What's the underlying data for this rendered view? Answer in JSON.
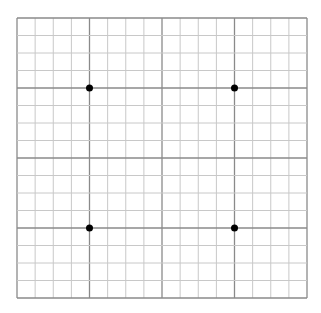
{
  "grid": {
    "left": 17,
    "top": 18,
    "right": 307,
    "bottom": 298,
    "columns": 16,
    "rows": 16,
    "major_every": 4,
    "minor_color": "#c8c8c8",
    "major_color": "#8a8a8a",
    "background": "#ffffff"
  },
  "points": [
    {
      "col": 4,
      "row": 4
    },
    {
      "col": 12,
      "row": 4
    },
    {
      "col": 4,
      "row": 12
    },
    {
      "col": 12,
      "row": 12
    }
  ],
  "point_color": "#000000",
  "point_radius": 3.5
}
